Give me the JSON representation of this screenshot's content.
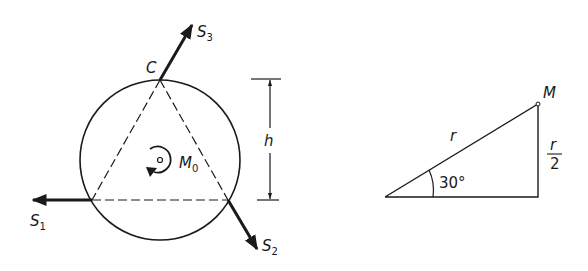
{
  "figure_left": {
    "title": "Three-force equilibrium on circular disk",
    "point_top_label": "C",
    "forces": [
      {
        "name": "S",
        "sub": "1"
      },
      {
        "name": "S",
        "sub": "2"
      },
      {
        "name": "S",
        "sub": "3"
      }
    ],
    "moment": {
      "name": "M",
      "sub": "0"
    },
    "dimension_label": "h"
  },
  "figure_right": {
    "point_label": "M",
    "hypotenuse_label": "r",
    "angle_label": "30°",
    "opposite_numerator": "r",
    "opposite_denominator": "2"
  },
  "colors": {
    "ink": "#1a1a1a",
    "background": "#ffffff"
  }
}
